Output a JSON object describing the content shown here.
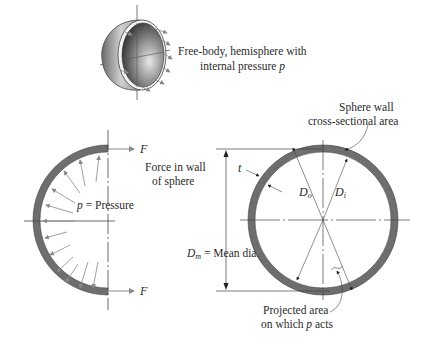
{
  "diagram": {
    "hemisphere_caption": {
      "line1": "Free-body, hemisphere with",
      "line2_prefix": "internal pressure ",
      "line2_var": "p"
    },
    "left_section": {
      "force_top": "F",
      "force_bottom": "F",
      "force_caption_line1": "Force in wall",
      "force_caption_line2": "of sphere",
      "pressure_var": "p",
      "pressure_label": " = Pressure"
    },
    "right_section": {
      "wall_caption_line1": "Sphere wall",
      "wall_caption_line2": "cross-sectional area",
      "thickness_var": "t",
      "outer_dia_var": "D",
      "outer_dia_sub": "o",
      "inner_dia_var": "D",
      "inner_dia_sub": "i",
      "mean_dia_var": "D",
      "mean_dia_sub": "m",
      "mean_dia_label": " = Mean dia.",
      "projected_caption_line1": "Projected area",
      "projected_caption_line2_prefix": "on which ",
      "projected_caption_line2_var": "p",
      "projected_caption_line2_suffix": " acts"
    },
    "colors": {
      "wall_fill": "#6e6e6e",
      "line": "#444444",
      "arrow": "#888888"
    }
  }
}
